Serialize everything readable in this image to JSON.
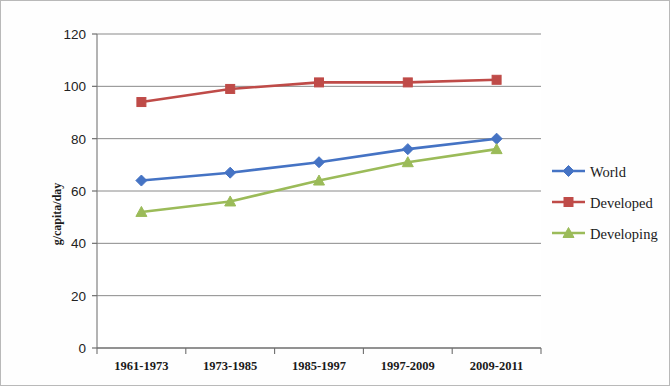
{
  "chart_data": {
    "type": "line",
    "title": "",
    "xlabel": "",
    "ylabel": "g/capita/day",
    "categories": [
      "1961-1973",
      "1973-1985",
      "1985-1997",
      "1997-2009",
      "2009-2011"
    ],
    "series": [
      {
        "name": "World",
        "color": "#4573c4",
        "marker": "diamond",
        "values": [
          64,
          67,
          71,
          76,
          80
        ]
      },
      {
        "name": "Developed",
        "color": "#bf4b48",
        "marker": "square",
        "values": [
          94,
          99,
          101.5,
          101.5,
          102.5
        ]
      },
      {
        "name": "Developing",
        "color": "#9bbb59",
        "marker": "triangle",
        "values": [
          52,
          56,
          64,
          71,
          76
        ]
      }
    ],
    "ylim": [
      0,
      120
    ],
    "ytick_labels": [
      "0",
      "20",
      "40",
      "60",
      "80",
      "100",
      "120"
    ],
    "yticks": [
      0,
      20,
      40,
      60,
      80,
      100,
      120
    ],
    "grid": "horizontal",
    "legend_position": "right"
  },
  "legend": {
    "entries": [
      {
        "label": "World"
      },
      {
        "label": "Developed"
      },
      {
        "label": "Developing"
      }
    ]
  }
}
